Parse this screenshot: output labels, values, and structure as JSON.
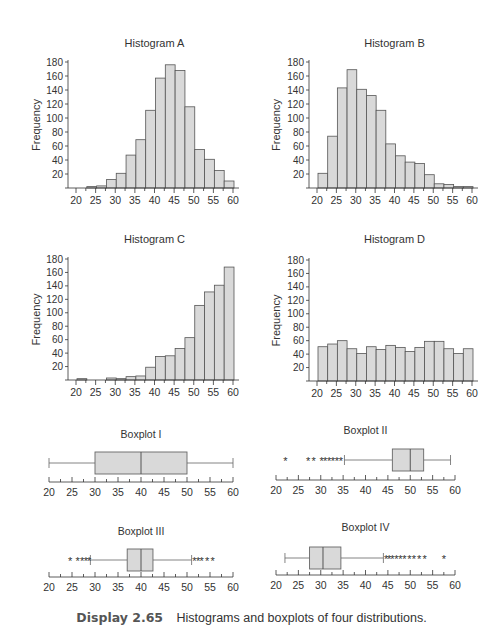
{
  "colors": {
    "bar_fill": "#d9d9d9",
    "bar_stroke": "#555555",
    "axis": "#333333",
    "text": "#333333"
  },
  "caption": {
    "number": "Display 2.65",
    "text": "Histograms and boxplots of four distributions."
  },
  "chart_data": [
    {
      "id": "hist-a",
      "type": "bar",
      "title": "Histogram A",
      "xlabel": "",
      "ylabel": "Frequency",
      "xlim": [
        20,
        60
      ],
      "ylim": [
        0,
        180
      ],
      "bin_width": 2.5,
      "xticks": [
        20,
        25,
        30,
        35,
        40,
        45,
        50,
        55,
        60
      ],
      "yticks": [
        20,
        40,
        60,
        80,
        100,
        120,
        140,
        160,
        180
      ],
      "bins_start": [
        20,
        22.5,
        25,
        27.5,
        30,
        32.5,
        35,
        37.5,
        40,
        42.5,
        45,
        47.5,
        50,
        52.5,
        55,
        57.5
      ],
      "values": [
        0,
        2,
        3,
        12,
        21,
        47,
        69,
        111,
        157,
        176,
        168,
        116,
        55,
        41,
        25,
        10,
        3,
        3,
        0
      ]
    },
    {
      "id": "hist-b",
      "type": "bar",
      "title": "Histogram B",
      "xlabel": "",
      "ylabel": "Frequency",
      "xlim": [
        20,
        60
      ],
      "ylim": [
        0,
        180
      ],
      "bin_width": 2.5,
      "xticks": [
        20,
        25,
        30,
        35,
        40,
        45,
        50,
        55,
        60
      ],
      "yticks": [
        20,
        40,
        60,
        80,
        100,
        120,
        140,
        160,
        180
      ],
      "values": [
        21,
        74,
        143,
        169,
        141,
        132,
        111,
        63,
        46,
        37,
        35,
        19,
        6,
        5,
        2,
        2,
        0,
        0,
        2
      ]
    },
    {
      "id": "hist-c",
      "type": "bar",
      "title": "Histogram C",
      "xlabel": "",
      "ylabel": "Frequency",
      "xlim": [
        20,
        60
      ],
      "ylim": [
        0,
        180
      ],
      "bin_width": 2.5,
      "xticks": [
        20,
        25,
        30,
        35,
        40,
        45,
        50,
        55,
        60
      ],
      "yticks": [
        20,
        40,
        60,
        80,
        100,
        120,
        140,
        160,
        180
      ],
      "values": [
        2,
        0,
        0,
        3,
        2,
        5,
        6,
        19,
        35,
        36,
        47,
        63,
        111,
        131,
        141,
        168,
        142,
        74,
        22
      ]
    },
    {
      "id": "hist-d",
      "type": "bar",
      "title": "Histogram D",
      "xlabel": "",
      "ylabel": "Frequency",
      "xlim": [
        20,
        60
      ],
      "ylim": [
        0,
        180
      ],
      "bin_width": 2.5,
      "xticks": [
        20,
        25,
        30,
        35,
        40,
        45,
        50,
        55,
        60
      ],
      "yticks": [
        20,
        40,
        60,
        80,
        100,
        120,
        140,
        160,
        180
      ],
      "values": [
        51,
        55,
        60,
        48,
        41,
        51,
        47,
        53,
        50,
        44,
        50,
        59,
        59,
        48,
        41,
        48,
        45,
        47,
        47,
        45
      ]
    },
    {
      "id": "box-1",
      "type": "boxplot",
      "title": "Boxplot I",
      "xlim": [
        20,
        60
      ],
      "xticks": [
        20,
        25,
        30,
        35,
        40,
        45,
        50,
        55,
        60
      ],
      "whisker_low": 20,
      "q1": 30,
      "median": 40,
      "q3": 50,
      "whisker_high": 60,
      "outliers": []
    },
    {
      "id": "box-2",
      "type": "boxplot",
      "title": "Boxplot II",
      "xlim": [
        20,
        60
      ],
      "xticks": [
        20,
        25,
        30,
        35,
        40,
        45,
        50,
        55,
        60
      ],
      "whisker_low": 35.3,
      "q1": 46,
      "median": 50,
      "q3": 53,
      "whisker_high": 59,
      "outliers": [
        22.1,
        27.2,
        28.4,
        30.2,
        31.0,
        31.9,
        32.7,
        33.6,
        34.5
      ]
    },
    {
      "id": "box-3",
      "type": "boxplot",
      "title": "Boxplot III",
      "xlim": [
        20,
        60
      ],
      "xticks": [
        20,
        25,
        30,
        35,
        40,
        45,
        50,
        55,
        60
      ],
      "whisker_low": 29,
      "q1": 37,
      "median": 40,
      "q3": 42.6,
      "whisker_high": 51,
      "outliers": [
        24.6,
        26.2,
        27.2,
        28.0,
        28.7,
        51.6,
        52.4,
        53.2,
        54.4,
        55.6
      ]
    },
    {
      "id": "box-4",
      "type": "boxplot",
      "title": "Boxplot IV",
      "xlim": [
        20,
        60
      ],
      "xticks": [
        20,
        25,
        30,
        35,
        40,
        45,
        50,
        55,
        60
      ],
      "whisker_low": 22,
      "q1": 27.5,
      "median": 30.5,
      "q3": 34.5,
      "whisker_high": 44,
      "outliers": [
        44.6,
        45.3,
        46.0,
        46.9,
        47.8,
        48.7,
        49.8,
        50.8,
        52.0,
        53.2,
        57.5
      ]
    }
  ]
}
